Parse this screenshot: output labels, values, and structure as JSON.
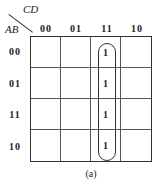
{
  "kmap": {
    "col_var": "CD",
    "row_var": "AB",
    "col_headers": [
      "00",
      "01",
      "11",
      "10"
    ],
    "row_headers": [
      "00",
      "01",
      "11",
      "10"
    ],
    "cells": [
      [
        "",
        "",
        "1",
        ""
      ],
      [
        "",
        "",
        "1",
        ""
      ],
      [
        "",
        "",
        "1",
        ""
      ],
      [
        "",
        "",
        "1",
        ""
      ]
    ],
    "groups": [
      {
        "column": "11",
        "rows": [
          "00",
          "01",
          "11",
          "10"
        ]
      }
    ],
    "caption": "(a)"
  }
}
